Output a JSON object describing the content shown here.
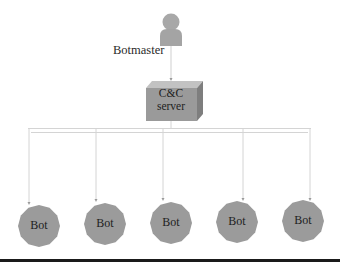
{
  "diagram": {
    "type": "centralized-botnet-topology",
    "botmaster": {
      "label": "Botmaster",
      "icon": "person-icon",
      "color": "#a6a6a6"
    },
    "cc_server": {
      "line1": "C&C",
      "line2": "server",
      "color_front": "#9a9a9a",
      "color_top": "#c4c4c4",
      "color_side": "#7d7d7d"
    },
    "bots": [
      {
        "label": "Bot"
      },
      {
        "label": "Bot"
      },
      {
        "label": "Bot"
      },
      {
        "label": "Bot"
      },
      {
        "label": "Bot"
      }
    ],
    "bot_color": "#9b9b9b",
    "connector_color": "#d0d0d0",
    "edges": [
      {
        "from": "Botmaster",
        "to": "C&C server"
      },
      {
        "from": "C&C server",
        "to": "Bot 1"
      },
      {
        "from": "C&C server",
        "to": "Bot 2"
      },
      {
        "from": "C&C server",
        "to": "Bot 3"
      },
      {
        "from": "C&C server",
        "to": "Bot 4"
      },
      {
        "from": "C&C server",
        "to": "Bot 5"
      }
    ]
  }
}
